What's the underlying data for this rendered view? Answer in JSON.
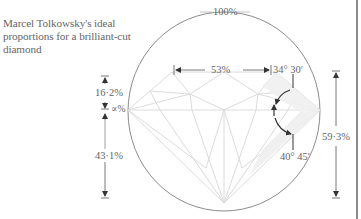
{
  "caption": "Marcel Tolkowsky's ideal proportions for a brilliant-cut diamond",
  "labels": {
    "diameter": "100%",
    "table": "53%",
    "crown_angle": "34° 30′",
    "crown_height": "16·2%",
    "girdle": "∝%",
    "pavilion_depth": "43·1%",
    "pavilion_angle": "40° 45′",
    "total_depth": "59·3%"
  },
  "colors": {
    "outline": "#8c8c8c",
    "facet": "#d9d9d9",
    "text": "#666666",
    "arrow": "#333333"
  }
}
